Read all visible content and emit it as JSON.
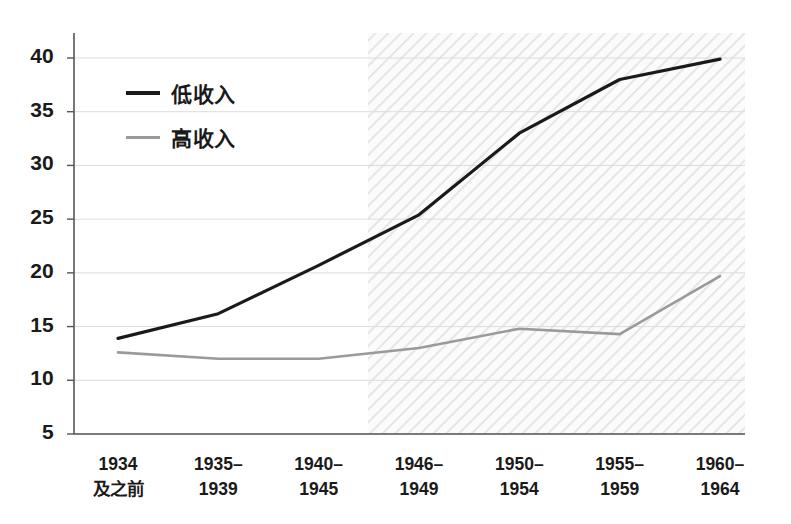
{
  "chart_data": {
    "type": "line",
    "title": "",
    "subtitle": "",
    "xlabel": "",
    "ylabel": "",
    "categories": [
      "1934\n及之前",
      "1935–\n1939",
      "1940–\n1945",
      "1946–\n1949",
      "1950–\n1954",
      "1955–\n1959",
      "1960–\n1964"
    ],
    "series": [
      {
        "name": "低收入",
        "color": "#1a1a1a",
        "values": [
          13.9,
          16.2,
          20.7,
          25.4,
          33.0,
          38.0,
          39.9
        ]
      },
      {
        "name": "高收入",
        "color": "#9a9a9a",
        "values": [
          12.6,
          12.0,
          12.0,
          13.0,
          14.8,
          14.3,
          19.7
        ]
      }
    ],
    "ylim": [
      5,
      40
    ],
    "yticks": [
      5,
      10,
      15,
      20,
      25,
      30,
      35,
      40
    ],
    "ytick_labels": [
      "5",
      "10",
      "15",
      "20",
      "25",
      "30",
      "35",
      "40"
    ],
    "grid": true,
    "grid_color": "#dcdcdc",
    "legend_position": "top-left",
    "shaded_region": {
      "from_category_index": 2.5,
      "to_category_index": 6,
      "style": "diagonal-hatch",
      "color": "#ececec"
    },
    "axis_color": "#555555",
    "background": "#ffffff"
  },
  "legend": {
    "items": [
      {
        "label": "低收入",
        "color": "#1a1a1a"
      },
      {
        "label": "高收入",
        "color": "#9a9a9a"
      }
    ]
  }
}
